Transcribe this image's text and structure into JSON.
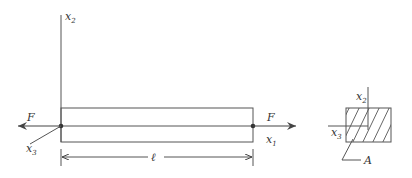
{
  "diagram": {
    "labels": {
      "axis_vertical": "x",
      "axis_vertical_sub": "2",
      "axis_horizontal": "x",
      "axis_horizontal_sub": "1",
      "axis_depth": "x",
      "axis_depth_sub": "3",
      "force_left": "F",
      "force_right": "F",
      "length": "ℓ"
    },
    "cross_section": {
      "axis_vertical": "x",
      "axis_vertical_sub": "2",
      "axis_depth": "x",
      "axis_depth_sub": "3",
      "area_label": "A"
    },
    "colors": {
      "line": "#555555",
      "text": "#333333"
    }
  }
}
